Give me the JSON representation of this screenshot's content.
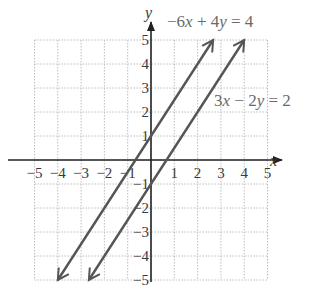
{
  "chart_data": {
    "type": "line",
    "title": "",
    "xlabel": "x",
    "ylabel": "y",
    "xlim": [
      -5,
      5
    ],
    "ylim": [
      -5,
      5
    ],
    "grid": true,
    "x_ticks": [
      -5,
      -4,
      -3,
      -2,
      -1,
      1,
      2,
      3,
      4,
      5
    ],
    "y_ticks": [
      5,
      4,
      3,
      2,
      1,
      -1,
      -2,
      -3,
      -4,
      -5
    ],
    "x_tick_labels": [
      "−5",
      "−4",
      "−3",
      "−2",
      "−1",
      "1",
      "2",
      "3",
      "4",
      "5"
    ],
    "y_tick_labels": [
      "5",
      "4",
      "3",
      "2",
      "1",
      "−1",
      "−2",
      "−3",
      "−4",
      "−5"
    ],
    "series": [
      {
        "name": "−6x + 4y = 4",
        "equation": "y = 1.5x + 1",
        "x": [
          -4,
          2.667
        ],
        "y": [
          -5,
          5
        ],
        "arrows": "both",
        "color": "#555555"
      },
      {
        "name": "3x − 2y = 2",
        "equation": "y = 1.5x − 1",
        "x": [
          -2.667,
          4
        ],
        "y": [
          -5,
          5
        ],
        "arrows": "both",
        "color": "#555555"
      }
    ],
    "annotations": [
      {
        "text": "−6x + 4y = 4",
        "position": "top, above right end of line 1"
      },
      {
        "text": "3x − 2y = 2",
        "position": "right of line 2 near y=2.5"
      }
    ]
  },
  "labels": {
    "x_axis": "x",
    "y_axis": "y",
    "eq1_a": "−6",
    "eq1_b": "x",
    "eq1_c": " + 4",
    "eq1_d": "y",
    "eq1_e": " = 4",
    "eq2_a": "3",
    "eq2_b": "x",
    "eq2_c": " − 2",
    "eq2_d": "y",
    "eq2_e": " = 2"
  }
}
